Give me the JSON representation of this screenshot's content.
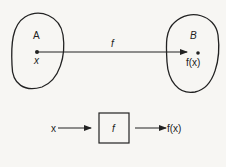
{
  "diagram": {
    "set_a": {
      "label": "A",
      "element": "x"
    },
    "set_b": {
      "label": "B",
      "element": "f(x)"
    },
    "mapping_label": "f",
    "block": {
      "input": "x",
      "function": "f",
      "output": "f(x)"
    }
  }
}
